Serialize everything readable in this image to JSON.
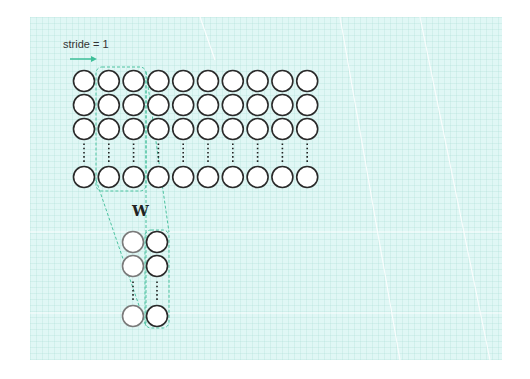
{
  "diagram": {
    "stride_label": "stride = 1",
    "kernel_label": "W",
    "input_grid": {
      "columns": 10,
      "visible_rows": 3,
      "ellipsis_rows": true,
      "last_row": true,
      "col_x": [
        84,
        108.8,
        133.6,
        158.4,
        183.2,
        208,
        232.8,
        257.6,
        282.4,
        307.2
      ],
      "row_y": [
        81,
        105,
        129,
        177
      ],
      "radius": 10.5,
      "highlighted_columns": [
        2,
        3
      ]
    },
    "kernel": {
      "columns": 2,
      "col_x": [
        133,
        157
      ],
      "row_y": [
        242,
        266,
        316
      ],
      "radius": 10.5,
      "highlighted_column": 2
    },
    "colors": {
      "panel_bg": "#e0f7f5",
      "circle_stroke": "#2a2a2a",
      "circle_stroke_light": "#7a7a7a",
      "circle_fill": "#ffffff",
      "accent": "#3dbf98",
      "dashed": "#4cc3a0"
    }
  }
}
